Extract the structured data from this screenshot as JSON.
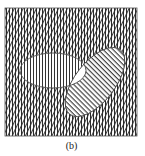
{
  "figure": {
    "caption": "(b)",
    "colors": {
      "background": "#ffffff",
      "line": "#333333",
      "outline": "#555555",
      "overlap_fill": "#ffffff"
    },
    "universe": {
      "shape": "square",
      "x": 5,
      "y": 8,
      "width": 132,
      "height": 128,
      "fill_pattern": "crosshatch-vertical-and-diagonal"
    },
    "set_a": {
      "shape": "ellipse",
      "cx": 53,
      "cy": 70.5,
      "rx": 33,
      "ry": 17.5,
      "rotation": 0,
      "fill_pattern": "vertical-lines"
    },
    "set_b": {
      "shape": "ellipse",
      "cx": 95,
      "cy": 82,
      "rx": 41,
      "ry": 20,
      "rotation": -52,
      "fill_pattern": "diagonal-lines"
    },
    "intersection": {
      "fill_pattern": "none"
    }
  }
}
